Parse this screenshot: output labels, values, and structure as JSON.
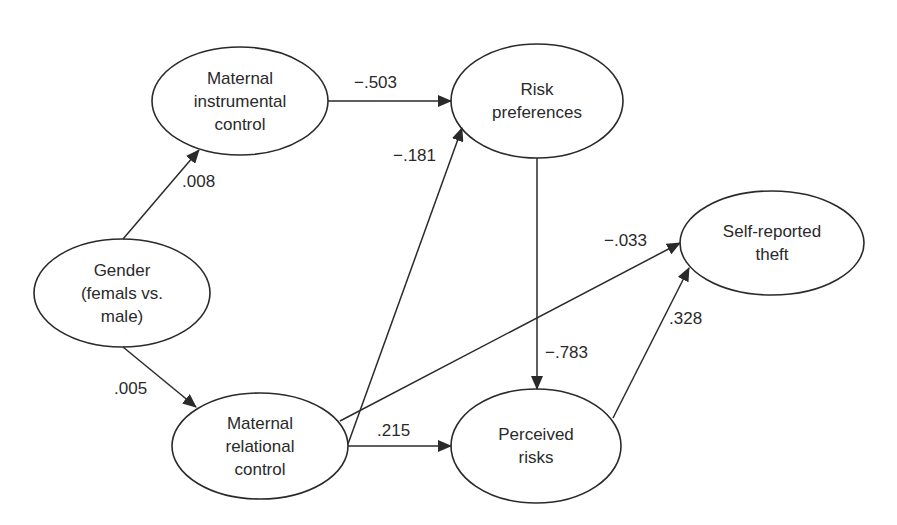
{
  "diagram": {
    "type": "path-model",
    "nodes": [
      {
        "id": "instrumental",
        "lines": [
          "Maternal",
          "instrumental",
          "control"
        ]
      },
      {
        "id": "risk_pref",
        "lines": [
          "Risk",
          "preferences"
        ]
      },
      {
        "id": "theft",
        "lines": [
          "Self-reported",
          "theft"
        ]
      },
      {
        "id": "gender",
        "lines": [
          "Gender",
          "(femals vs.",
          "male)"
        ]
      },
      {
        "id": "relational",
        "lines": [
          "Maternal",
          "relational",
          "control"
        ]
      },
      {
        "id": "perceived",
        "lines": [
          "Perceived",
          "risks"
        ]
      }
    ],
    "edges": [
      {
        "from": "gender",
        "to": "instrumental",
        "coef": ".008"
      },
      {
        "from": "gender",
        "to": "relational",
        "coef": ".005"
      },
      {
        "from": "instrumental",
        "to": "risk_pref",
        "coef": "−.503"
      },
      {
        "from": "relational",
        "to": "risk_pref",
        "coef": "−.181"
      },
      {
        "from": "relational",
        "to": "theft",
        "coef": "−.033"
      },
      {
        "from": "relational",
        "to": "perceived",
        "coef": ".215"
      },
      {
        "from": "risk_pref",
        "to": "perceived",
        "coef": "−.783"
      },
      {
        "from": "perceived",
        "to": "theft",
        "coef": ".328"
      }
    ],
    "colors": {
      "stroke": "#2a2a2a",
      "background": "#ffffff"
    }
  }
}
